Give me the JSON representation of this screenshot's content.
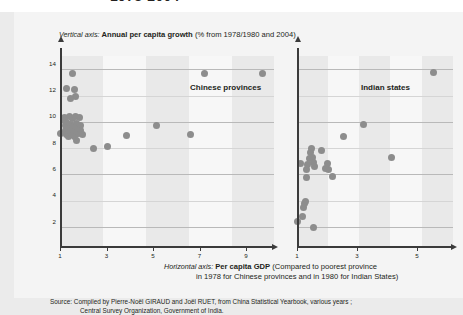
{
  "top_title": "1978-2004",
  "credit": "Sciences Po / CERI et Atelier de cartographie, March 2008",
  "captions": {
    "vertical_prefix": "Vertical axis:",
    "vertical_bold": "Annual per capita growth",
    "vertical_suffix": "(% from 1978/1980 and 2004)",
    "horizontal_prefix": "Horizontal axis:",
    "horizontal_bold": "Per capita GDP",
    "horizontal_suffix": "(Compared to poorest province",
    "horizontal_line2": "in 1978 for Chinese provinces and in 1980 for Indian States)"
  },
  "source": {
    "line1": "Source: Compiled by Pierre-Noël GIRAUD and Joël RUET, from China Statistical Yearbook, various years ;",
    "line2": "Central Survey Organization, Government of India."
  },
  "colors": {
    "dot": "#8d8d8d",
    "axis": "#3b3b3b",
    "gridline": "#b9b9b9",
    "band": "#e6e6e6",
    "plot_bg": "#f7f7f7",
    "page_bg": "#ebebeb"
  },
  "chart_data": [
    {
      "type": "scatter",
      "id": "chinese-provinces",
      "title": "Chinese provinces",
      "xlabel": "Per capita GDP (Compared to poorest province in 1978)",
      "ylabel": "Annual per capita growth (%)",
      "xlim": [
        1,
        10.2
      ],
      "ylim": [
        0,
        14.6
      ],
      "xticks": [
        1,
        3,
        5,
        7,
        9
      ],
      "yticks": [
        2,
        4,
        6,
        8,
        10,
        12,
        14
      ],
      "grid": "horizontal",
      "legend": "none",
      "points": [
        {
          "x": 1.0,
          "y": 8.7
        },
        {
          "x": 1.18,
          "y": 9.95
        },
        {
          "x": 1.2,
          "y": 9.7
        },
        {
          "x": 1.22,
          "y": 9.3
        },
        {
          "x": 1.25,
          "y": 8.95
        },
        {
          "x": 1.27,
          "y": 8.65
        },
        {
          "x": 1.3,
          "y": 9.55
        },
        {
          "x": 1.33,
          "y": 9.2
        },
        {
          "x": 1.35,
          "y": 8.8
        },
        {
          "x": 1.38,
          "y": 8.5
        },
        {
          "x": 1.4,
          "y": 10.0
        },
        {
          "x": 1.43,
          "y": 9.4
        },
        {
          "x": 1.46,
          "y": 9.05
        },
        {
          "x": 1.48,
          "y": 8.62
        },
        {
          "x": 1.52,
          "y": 9.85
        },
        {
          "x": 1.55,
          "y": 9.25
        },
        {
          "x": 1.58,
          "y": 8.88
        },
        {
          "x": 1.62,
          "y": 8.45
        },
        {
          "x": 1.66,
          "y": 9.98
        },
        {
          "x": 1.7,
          "y": 9.45
        },
        {
          "x": 1.74,
          "y": 9.1
        },
        {
          "x": 1.78,
          "y": 8.72
        },
        {
          "x": 1.82,
          "y": 9.9
        },
        {
          "x": 1.86,
          "y": 9.35
        },
        {
          "x": 1.9,
          "y": 8.95
        },
        {
          "x": 1.95,
          "y": 8.6
        },
        {
          "x": 1.72,
          "y": 8.15
        },
        {
          "x": 1.55,
          "y": 13.3
        },
        {
          "x": 1.3,
          "y": 12.1
        },
        {
          "x": 1.62,
          "y": 12.05
        },
        {
          "x": 1.68,
          "y": 11.55
        },
        {
          "x": 1.45,
          "y": 11.4
        },
        {
          "x": 2.45,
          "y": 7.55
        },
        {
          "x": 3.05,
          "y": 7.75
        },
        {
          "x": 3.85,
          "y": 8.55
        },
        {
          "x": 5.15,
          "y": 9.35
        },
        {
          "x": 6.6,
          "y": 8.65
        },
        {
          "x": 7.2,
          "y": 13.25
        },
        {
          "x": 9.7,
          "y": 13.3
        }
      ]
    },
    {
      "type": "scatter",
      "id": "indian-states",
      "title": "Indian states",
      "xlabel": "Per capita GDP (Compared to poorest province in 1980)",
      "ylabel": "Annual per capita growth (%)",
      "xlim": [
        1,
        6.2
      ],
      "ylim": [
        0,
        14.6
      ],
      "xticks": [
        1,
        3,
        5
      ],
      "yticks": [
        2,
        4,
        6,
        8,
        10,
        12,
        14
      ],
      "grid": "horizontal",
      "legend": "none",
      "points": [
        {
          "x": 1.0,
          "y": 2.05
        },
        {
          "x": 1.18,
          "y": 2.4
        },
        {
          "x": 1.22,
          "y": 3.05
        },
        {
          "x": 1.25,
          "y": 3.35
        },
        {
          "x": 1.28,
          "y": 3.55
        },
        {
          "x": 1.55,
          "y": 1.55
        },
        {
          "x": 1.1,
          "y": 6.45
        },
        {
          "x": 1.3,
          "y": 5.35
        },
        {
          "x": 1.33,
          "y": 5.95
        },
        {
          "x": 1.36,
          "y": 6.35
        },
        {
          "x": 1.4,
          "y": 6.8
        },
        {
          "x": 1.44,
          "y": 7.25
        },
        {
          "x": 1.47,
          "y": 7.55
        },
        {
          "x": 1.5,
          "y": 6.9
        },
        {
          "x": 1.54,
          "y": 6.5
        },
        {
          "x": 1.58,
          "y": 6.2
        },
        {
          "x": 1.8,
          "y": 7.45
        },
        {
          "x": 2.02,
          "y": 6.45
        },
        {
          "x": 2.05,
          "y": 5.95
        },
        {
          "x": 2.18,
          "y": 5.45
        },
        {
          "x": 1.95,
          "y": 6.05
        },
        {
          "x": 2.55,
          "y": 8.45
        },
        {
          "x": 3.2,
          "y": 9.4
        },
        {
          "x": 4.15,
          "y": 6.85
        },
        {
          "x": 5.55,
          "y": 13.35
        }
      ]
    }
  ]
}
